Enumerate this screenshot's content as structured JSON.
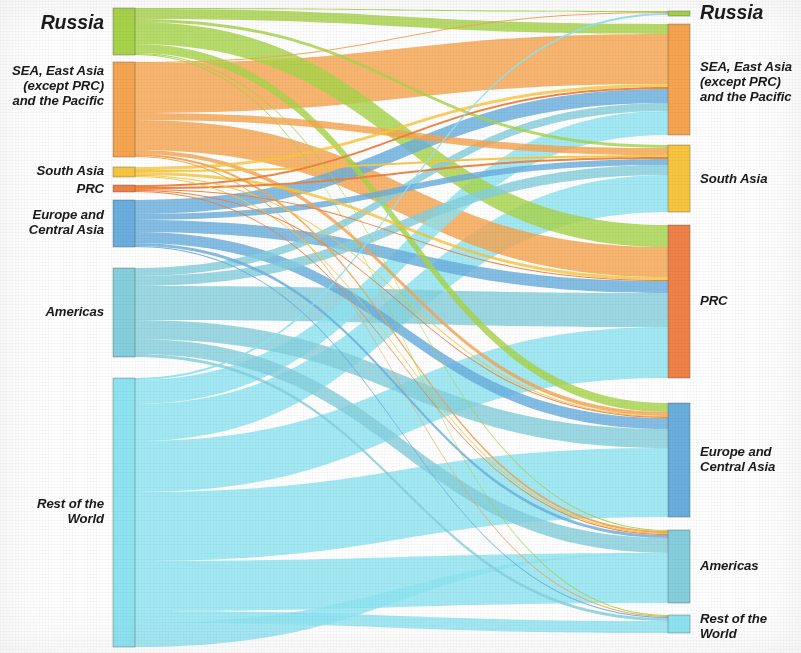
{
  "figure": {
    "type": "sankey",
    "background": "#ffffff",
    "width": 801,
    "height": 653
  },
  "palette": {
    "russia_green": "#a8d44a",
    "sea_orange": "#f6a550",
    "south_asia_yellow": "#f8c63f",
    "prc_orange_dark": "#f07f3c",
    "europe_blue": "#6aaede",
    "americas_teal": "#86cfdd",
    "row_cyan": "#8fe4f2"
  },
  "left_axis": {
    "title": "source-nodes",
    "nodes": [
      {
        "id": "russia",
        "label": "Russia",
        "color_key": "russia_green",
        "color": "#a8d44a",
        "y0": 8,
        "y1": 55,
        "label_style": "lbl-big",
        "label_y": 12,
        "value": 47
      },
      {
        "id": "sea",
        "label": "SEA, East Asia\n(except PRC)\nand the Pacific",
        "color_key": "sea_orange",
        "color": "#f6a550",
        "y0": 62,
        "y1": 157,
        "label_style": "lbl-med",
        "label_y": 64,
        "value": 95
      },
      {
        "id": "south_asia",
        "label": "South Asia",
        "color_key": "south_asia_yellow",
        "color": "#f8c63f",
        "y0": 167,
        "y1": 177,
        "label_style": "lbl-med",
        "label_y": 164,
        "value": 10
      },
      {
        "id": "prc",
        "label": "PRC",
        "color_key": "prc_orange_dark",
        "color": "#ef8248",
        "y0": 185,
        "y1": 192,
        "label_style": "lbl-med",
        "label_y": 182,
        "value": 7
      },
      {
        "id": "europe",
        "label": "Europe and\nCentral Asia",
        "color_key": "europe_blue",
        "color": "#6aaede",
        "y0": 200,
        "y1": 247,
        "label_style": "lbl-med",
        "label_y": 208,
        "value": 47
      },
      {
        "id": "americas",
        "label": "Americas",
        "color_key": "americas_teal",
        "color": "#86cfdd",
        "y0": 268,
        "y1": 357,
        "label_style": "lbl-med",
        "label_y": 305,
        "value": 89
      },
      {
        "id": "row",
        "label": "Rest of the\nWorld",
        "color_key": "row_cyan",
        "color": "#8fe4f2",
        "y0": 378,
        "y1": 647,
        "label_style": "lbl-med",
        "label_y": 497,
        "value": 269
      }
    ]
  },
  "right_axis": {
    "title": "target-nodes",
    "nodes": [
      {
        "id": "russia_r",
        "label": "Russia",
        "color": "#a8d44a",
        "y0": 11,
        "y1": 16,
        "label_style": "lbl-big",
        "label_y": 2,
        "value": 5
      },
      {
        "id": "sea_r",
        "label": "SEA, East Asia\n(except PRC)\nand the Pacific",
        "color": "#f6a550",
        "y0": 24,
        "y1": 135,
        "label_style": "lbl-med",
        "label_y": 60,
        "value": 111
      },
      {
        "id": "south_asia_r",
        "label": "South Asia",
        "color": "#f8c63f",
        "y0": 145,
        "y1": 212,
        "label_style": "lbl-med",
        "label_y": 172,
        "value": 67
      },
      {
        "id": "prc_r",
        "label": "PRC",
        "color": "#ef8248",
        "y0": 225,
        "y1": 378,
        "label_style": "lbl-med",
        "label_y": 294,
        "value": 153
      },
      {
        "id": "europe_r",
        "label": "Europe and\nCentral Asia",
        "color": "#6aaede",
        "y0": 403,
        "y1": 517,
        "label_style": "lbl-med",
        "label_y": 445,
        "value": 114
      },
      {
        "id": "americas_r",
        "label": "Americas",
        "color": "#86cfdd",
        "y0": 530,
        "y1": 603,
        "label_style": "lbl-med",
        "label_y": 559,
        "value": 73
      },
      {
        "id": "row_r",
        "label": "Rest of the\nWorld",
        "color": "#8fe4f2",
        "y0": 615,
        "y1": 633,
        "label_style": "lbl-med",
        "label_y": 612,
        "value": 18
      }
    ]
  },
  "chart_data": {
    "type": "sankey",
    "title": "",
    "xlabel": "",
    "ylabel": "",
    "legend_position": "none",
    "grid": false,
    "node_columns": [
      "Russia",
      "SEA, East Asia (except PRC) and the Pacific",
      "South Asia",
      "PRC",
      "Europe and Central Asia",
      "Americas",
      "Rest of the World"
    ],
    "nodes_left": [
      {
        "name": "Russia",
        "value": 47
      },
      {
        "name": "SEA, East Asia (except PRC) and the Pacific",
        "value": 95
      },
      {
        "name": "South Asia",
        "value": 10
      },
      {
        "name": "PRC",
        "value": 7
      },
      {
        "name": "Europe and Central Asia",
        "value": 47
      },
      {
        "name": "Americas",
        "value": 89
      },
      {
        "name": "Rest of the World",
        "value": 269
      }
    ],
    "nodes_right": [
      {
        "name": "Russia",
        "value": 5
      },
      {
        "name": "SEA, East Asia (except PRC) and the Pacific",
        "value": 111
      },
      {
        "name": "South Asia",
        "value": 67
      },
      {
        "name": "PRC",
        "value": 153
      },
      {
        "name": "Europe and Central Asia",
        "value": 114
      },
      {
        "name": "Americas",
        "value": 73
      },
      {
        "name": "Rest of the World",
        "value": 18
      }
    ],
    "links": [
      {
        "source": "Russia",
        "target": "Russia",
        "value": 1,
        "sy0": 8,
        "sy1": 9,
        "ty0": 11,
        "ty1": 12
      },
      {
        "source": "Russia",
        "target": "SEA, East Asia (except PRC) and the Pacific",
        "value": 10,
        "sy0": 9,
        "sy1": 19,
        "ty0": 24,
        "ty1": 34
      },
      {
        "source": "Russia",
        "target": "South Asia",
        "value": 3,
        "sy0": 19,
        "sy1": 22,
        "ty0": 145,
        "ty1": 148
      },
      {
        "source": "Russia",
        "target": "PRC",
        "value": 22,
        "sy0": 22,
        "sy1": 44,
        "ty0": 225,
        "ty1": 247
      },
      {
        "source": "Russia",
        "target": "Europe and Central Asia",
        "value": 9,
        "sy0": 44,
        "sy1": 53,
        "ty0": 403,
        "ty1": 412
      },
      {
        "source": "Russia",
        "target": "Americas",
        "value": 1,
        "sy0": 53,
        "sy1": 54,
        "ty0": 530,
        "ty1": 531
      },
      {
        "source": "Russia",
        "target": "Rest of the World",
        "value": 1,
        "sy0": 54,
        "sy1": 55,
        "ty0": 615,
        "ty1": 616
      },
      {
        "source": "SEA, East Asia (except PRC) and the Pacific",
        "target": "Russia",
        "value": 1,
        "sy0": 62,
        "sy1": 63,
        "ty0": 12,
        "ty1": 13
      },
      {
        "source": "SEA, East Asia (except PRC) and the Pacific",
        "target": "SEA, East Asia (except PRC) and the Pacific",
        "value": 50,
        "sy0": 63,
        "sy1": 113,
        "ty0": 34,
        "ty1": 84
      },
      {
        "source": "SEA, East Asia (except PRC) and the Pacific",
        "target": "South Asia",
        "value": 7,
        "sy0": 113,
        "sy1": 120,
        "ty0": 148,
        "ty1": 155
      },
      {
        "source": "SEA, East Asia (except PRC) and the Pacific",
        "target": "PRC",
        "value": 30,
        "sy0": 120,
        "sy1": 150,
        "ty0": 247,
        "ty1": 277
      },
      {
        "source": "SEA, East Asia (except PRC) and the Pacific",
        "target": "Europe and Central Asia",
        "value": 4,
        "sy0": 150,
        "sy1": 154,
        "ty0": 412,
        "ty1": 416
      },
      {
        "source": "SEA, East Asia (except PRC) and the Pacific",
        "target": "Americas",
        "value": 2,
        "sy0": 154,
        "sy1": 156,
        "ty0": 531,
        "ty1": 533
      },
      {
        "source": "SEA, East Asia (except PRC) and the Pacific",
        "target": "Rest of the World",
        "value": 1,
        "sy0": 156,
        "sy1": 157,
        "ty0": 616,
        "ty1": 617
      },
      {
        "source": "South Asia",
        "target": "SEA, East Asia (except PRC) and the Pacific",
        "value": 3,
        "sy0": 167,
        "sy1": 170,
        "ty0": 84,
        "ty1": 87
      },
      {
        "source": "South Asia",
        "target": "South Asia",
        "value": 2,
        "sy0": 170,
        "sy1": 172,
        "ty0": 155,
        "ty1": 157
      },
      {
        "source": "South Asia",
        "target": "PRC",
        "value": 3,
        "sy0": 172,
        "sy1": 175,
        "ty0": 277,
        "ty1": 280
      },
      {
        "source": "South Asia",
        "target": "Europe and Central Asia",
        "value": 1,
        "sy0": 175,
        "sy1": 176,
        "ty0": 416,
        "ty1": 417
      },
      {
        "source": "South Asia",
        "target": "Americas",
        "value": 1,
        "sy0": 176,
        "sy1": 177,
        "ty0": 533,
        "ty1": 534
      },
      {
        "source": "PRC",
        "target": "SEA, East Asia (except PRC) and the Pacific",
        "value": 2,
        "sy0": 185,
        "sy1": 187,
        "ty0": 87,
        "ty1": 89
      },
      {
        "source": "PRC",
        "target": "South Asia",
        "value": 2,
        "sy0": 187,
        "sy1": 189,
        "ty0": 157,
        "ty1": 159
      },
      {
        "source": "PRC",
        "target": "PRC",
        "value": 1,
        "sy0": 189,
        "sy1": 190,
        "ty0": 280,
        "ty1": 281
      },
      {
        "source": "PRC",
        "target": "Europe and Central Asia",
        "value": 1,
        "sy0": 190,
        "sy1": 191,
        "ty0": 417,
        "ty1": 418
      },
      {
        "source": "PRC",
        "target": "Americas",
        "value": 1,
        "sy0": 191,
        "sy1": 192,
        "ty0": 534,
        "ty1": 535
      },
      {
        "source": "Europe and Central Asia",
        "target": "SEA, East Asia (except PRC) and the Pacific",
        "value": 14,
        "sy0": 200,
        "sy1": 214,
        "ty0": 89,
        "ty1": 103
      },
      {
        "source": "Europe and Central Asia",
        "target": "South Asia",
        "value": 6,
        "sy0": 214,
        "sy1": 220,
        "ty0": 159,
        "ty1": 165
      },
      {
        "source": "Europe and Central Asia",
        "target": "PRC",
        "value": 12,
        "sy0": 220,
        "sy1": 232,
        "ty0": 281,
        "ty1": 293
      },
      {
        "source": "Europe and Central Asia",
        "target": "Europe and Central Asia",
        "value": 11,
        "sy0": 232,
        "sy1": 243,
        "ty0": 418,
        "ty1": 429
      },
      {
        "source": "Europe and Central Asia",
        "target": "Americas",
        "value": 3,
        "sy0": 243,
        "sy1": 246,
        "ty0": 535,
        "ty1": 538
      },
      {
        "source": "Europe and Central Asia",
        "target": "Rest of the World",
        "value": 1,
        "sy0": 246,
        "sy1": 247,
        "ty0": 617,
        "ty1": 618
      },
      {
        "source": "Americas",
        "target": "SEA, East Asia (except PRC) and the Pacific",
        "value": 8,
        "sy0": 268,
        "sy1": 276,
        "ty0": 103,
        "ty1": 111
      },
      {
        "source": "Americas",
        "target": "South Asia",
        "value": 10,
        "sy0": 276,
        "sy1": 286,
        "ty0": 165,
        "ty1": 175
      },
      {
        "source": "Americas",
        "target": "PRC",
        "value": 34,
        "sy0": 286,
        "sy1": 320,
        "ty0": 293,
        "ty1": 327
      },
      {
        "source": "Americas",
        "target": "Europe and Central Asia",
        "value": 19,
        "sy0": 320,
        "sy1": 339,
        "ty0": 429,
        "ty1": 448
      },
      {
        "source": "Americas",
        "target": "Americas",
        "value": 15,
        "sy0": 339,
        "sy1": 354,
        "ty0": 538,
        "ty1": 553
      },
      {
        "source": "Americas",
        "target": "Rest of the World",
        "value": 3,
        "sy0": 354,
        "sy1": 357,
        "ty0": 618,
        "ty1": 621
      },
      {
        "source": "Rest of the World",
        "target": "Russia",
        "value": 2,
        "sy0": 378,
        "sy1": 380,
        "ty0": 13,
        "ty1": 15
      },
      {
        "source": "Rest of the World",
        "target": "SEA, East Asia (except PRC) and the Pacific",
        "value": 24,
        "sy0": 380,
        "sy1": 404,
        "ty0": 111,
        "ty1": 135
      },
      {
        "source": "Rest of the World",
        "target": "South Asia",
        "value": 37,
        "sy0": 404,
        "sy1": 441,
        "ty0": 175,
        "ty1": 212
      },
      {
        "source": "Rest of the World",
        "target": "PRC",
        "value": 51,
        "sy0": 441,
        "sy1": 492,
        "ty0": 327,
        "ty1": 378
      },
      {
        "source": "Rest of the World",
        "target": "Europe and Central Asia",
        "value": 69,
        "sy0": 492,
        "sy1": 561,
        "ty0": 448,
        "ty1": 517
      },
      {
        "source": "Rest of the World",
        "target": "Americas",
        "value": 50,
        "sy0": 561,
        "sy1": 611,
        "ty0": 553,
        "ty1": 603
      },
      {
        "source": "Rest of the World",
        "target": "Rest of the World",
        "value": 12,
        "sy0": 611,
        "sy1": 623,
        "ty0": 621,
        "ty1": 633
      },
      {
        "source": "Rest of the World",
        "target": "Americas",
        "value": 24,
        "sy0": 623,
        "sy1": 647,
        "ty0": 553,
        "ty1": 553
      }
    ],
    "node_x": {
      "left": 113,
      "left_width": 22,
      "right": 668,
      "right_width": 22
    }
  }
}
